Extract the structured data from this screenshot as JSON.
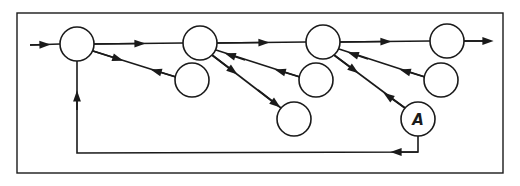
{
  "diagram": {
    "frame": {
      "x": 17,
      "y": 13,
      "width": 486,
      "height": 160
    },
    "stroke_color": "#1a1a1a",
    "background": "#ffffff",
    "nodes": [
      {
        "id": "n1",
        "cx": 77,
        "cy": 44,
        "r": 17,
        "label": ""
      },
      {
        "id": "n2",
        "cx": 200,
        "cy": 43,
        "r": 17,
        "label": ""
      },
      {
        "id": "n3",
        "cx": 323,
        "cy": 42,
        "r": 17,
        "label": ""
      },
      {
        "id": "n4",
        "cx": 447,
        "cy": 41,
        "r": 17,
        "label": ""
      },
      {
        "id": "c1",
        "cx": 192,
        "cy": 80,
        "r": 17,
        "label": ""
      },
      {
        "id": "c2",
        "cx": 316,
        "cy": 80,
        "r": 17,
        "label": ""
      },
      {
        "id": "c3",
        "cx": 294,
        "cy": 119,
        "r": 17,
        "label": ""
      },
      {
        "id": "c4",
        "cx": 441,
        "cy": 80,
        "r": 17,
        "label": ""
      },
      {
        "id": "a",
        "cx": 418,
        "cy": 119,
        "r": 17,
        "label": "A"
      }
    ],
    "edges": [
      {
        "from": "input",
        "to": "n1",
        "type": "forward"
      },
      {
        "from": "n1",
        "to": "n2",
        "type": "forward"
      },
      {
        "from": "n2",
        "to": "n3",
        "type": "forward"
      },
      {
        "from": "n3",
        "to": "n4",
        "type": "forward"
      },
      {
        "from": "n4",
        "to": "output",
        "type": "forward"
      },
      {
        "from": "n1",
        "to": "c1",
        "type": "bidirectional"
      },
      {
        "from": "n2",
        "to": "c2",
        "type": "bidirectional"
      },
      {
        "from": "n2",
        "to": "c3",
        "type": "bidirectional"
      },
      {
        "from": "n3",
        "to": "c4",
        "type": "bidirectional"
      },
      {
        "from": "n3",
        "to": "a",
        "type": "bidirectional"
      },
      {
        "from": "a",
        "to": "n1",
        "type": "feedback"
      }
    ]
  }
}
